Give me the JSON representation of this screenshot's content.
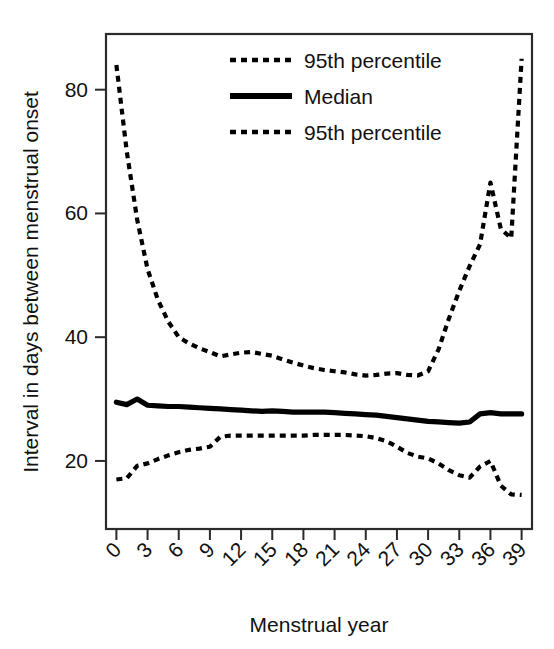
{
  "chart_data": {
    "type": "line",
    "title": "",
    "xlabel": "Menstrual year",
    "ylabel": "Interval in days between menstrual onset",
    "xlim": [
      -1,
      40
    ],
    "ylim": [
      9,
      89
    ],
    "xticks": [
      0,
      3,
      6,
      9,
      12,
      15,
      18,
      21,
      24,
      27,
      30,
      33,
      36,
      39
    ],
    "xticklabels": [
      "0",
      "3",
      "6",
      "9",
      "12",
      "15",
      "18",
      "21",
      "24",
      "27",
      "30",
      "33",
      "36",
      "39"
    ],
    "xtick_rotation_deg": 45,
    "yticks": [
      20,
      40,
      60,
      80
    ],
    "yticklabels": [
      "20",
      "40",
      "60",
      "80"
    ],
    "grid": false,
    "legend_position": "top-center",
    "frame": "box",
    "line_color": "#000000",
    "x": [
      0,
      1,
      2,
      3,
      4,
      5,
      6,
      7,
      8,
      9,
      10,
      11,
      12,
      13,
      14,
      15,
      16,
      17,
      18,
      19,
      20,
      21,
      22,
      23,
      24,
      25,
      26,
      27,
      28,
      29,
      30,
      31,
      32,
      33,
      34,
      35,
      36,
      37,
      38,
      39
    ],
    "series": [
      {
        "name": "95th percentile",
        "style": "dashed",
        "position": "upper",
        "values": [
          84.0,
          70.0,
          59.0,
          51.0,
          46.0,
          42.5,
          40.0,
          39.0,
          38.2,
          37.6,
          36.9,
          37.2,
          37.5,
          37.6,
          37.3,
          37.0,
          36.4,
          35.9,
          35.4,
          35.0,
          34.7,
          34.5,
          34.3,
          34.0,
          33.8,
          33.9,
          34.1,
          34.2,
          33.9,
          33.8,
          34.5,
          38.0,
          43.0,
          47.5,
          51.5,
          55.0,
          65.0,
          57.5,
          56.0,
          85.0
        ]
      },
      {
        "name": "Median",
        "style": "solid",
        "position": "middle",
        "values": [
          29.5,
          29.1,
          30.0,
          29.0,
          28.9,
          28.8,
          28.8,
          28.7,
          28.6,
          28.5,
          28.4,
          28.3,
          28.2,
          28.1,
          28.0,
          28.1,
          28.0,
          27.9,
          27.9,
          27.9,
          27.9,
          27.8,
          27.7,
          27.6,
          27.5,
          27.4,
          27.2,
          27.0,
          26.8,
          26.6,
          26.4,
          26.3,
          26.2,
          26.1,
          26.3,
          27.6,
          27.8,
          27.6,
          27.6,
          27.6
        ]
      },
      {
        "name": "95th percentile",
        "style": "dashed",
        "position": "lower",
        "values": [
          17.0,
          17.2,
          19.2,
          19.6,
          20.3,
          20.9,
          21.4,
          21.8,
          22.0,
          22.3,
          23.9,
          24.1,
          24.1,
          24.1,
          24.1,
          24.1,
          24.1,
          24.1,
          24.1,
          24.2,
          24.2,
          24.2,
          24.2,
          24.1,
          24.0,
          23.7,
          23.2,
          22.3,
          21.3,
          20.7,
          20.4,
          19.6,
          18.5,
          17.7,
          17.3,
          19.1,
          20.0,
          16.0,
          14.6,
          14.5
        ]
      }
    ],
    "legend": [
      {
        "label": "95th percentile",
        "style": "dashed"
      },
      {
        "label": "Median",
        "style": "solid"
      },
      {
        "label": "95th percentile",
        "style": "dashed"
      }
    ]
  }
}
